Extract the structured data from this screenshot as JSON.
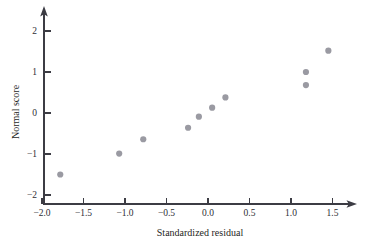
{
  "chart_data": {
    "type": "scatter",
    "title": "",
    "xlabel": "Standardized residual",
    "ylabel": "Normal score",
    "xlim": [
      -2.1,
      1.75
    ],
    "ylim": [
      -2.25,
      2.3
    ],
    "xticks": [
      -2.0,
      -1.5,
      -1.0,
      -0.5,
      0.0,
      0.5,
      1.0,
      1.5
    ],
    "xticklabels": [
      "−2.0",
      "−1.5",
      "−1.0",
      "−0.5",
      "0.0",
      "0.5",
      "1.0",
      "1.5"
    ],
    "yticks": [
      -2,
      -1,
      0,
      1,
      2
    ],
    "yticklabels": [
      "−2",
      "−1",
      "0",
      "1",
      "2"
    ],
    "grid": false,
    "legend": false,
    "marker": {
      "shape": "circle",
      "color": "#9a9aa2",
      "size": 3.1
    },
    "points": [
      {
        "x": -1.78,
        "y": -1.5
      },
      {
        "x": -1.07,
        "y": -0.99
      },
      {
        "x": -0.78,
        "y": -0.64
      },
      {
        "x": -0.24,
        "y": -0.36
      },
      {
        "x": -0.11,
        "y": -0.09
      },
      {
        "x": 0.05,
        "y": 0.13
      },
      {
        "x": 0.21,
        "y": 0.38
      },
      {
        "x": 1.18,
        "y": 0.68
      },
      {
        "x": 1.18,
        "y": 1.0
      },
      {
        "x": 1.45,
        "y": 1.52
      }
    ],
    "series": [
      {
        "name": "normal probability plot",
        "x": [
          -1.78,
          -1.07,
          -0.78,
          -0.24,
          -0.11,
          0.05,
          0.21,
          1.18,
          1.18,
          1.45
        ],
        "values": [
          -1.5,
          -0.99,
          -0.64,
          -0.36,
          -0.09,
          0.13,
          0.38,
          0.68,
          1.0,
          1.52
        ]
      }
    ]
  }
}
